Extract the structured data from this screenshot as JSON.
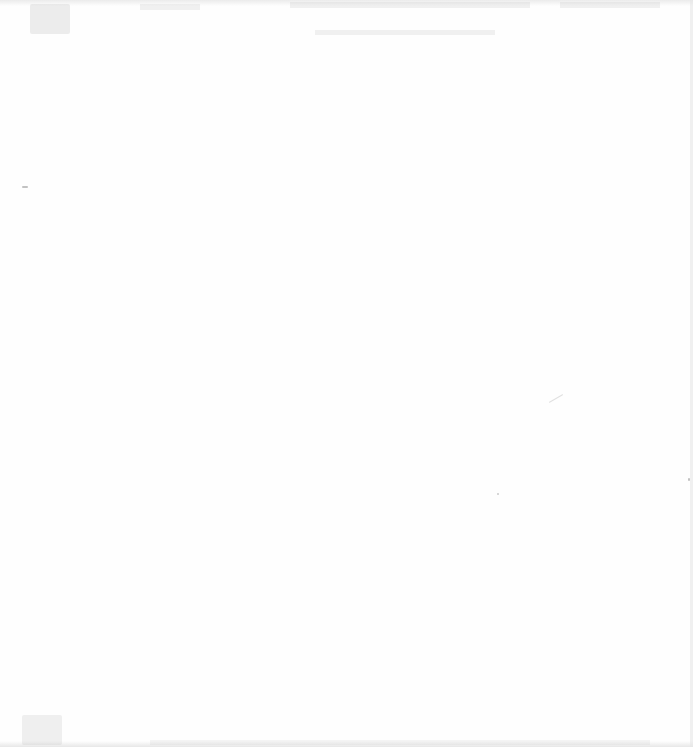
{
  "document": {
    "type": "scanned-page",
    "legible_text": [],
    "background_color": "#fefefe"
  }
}
